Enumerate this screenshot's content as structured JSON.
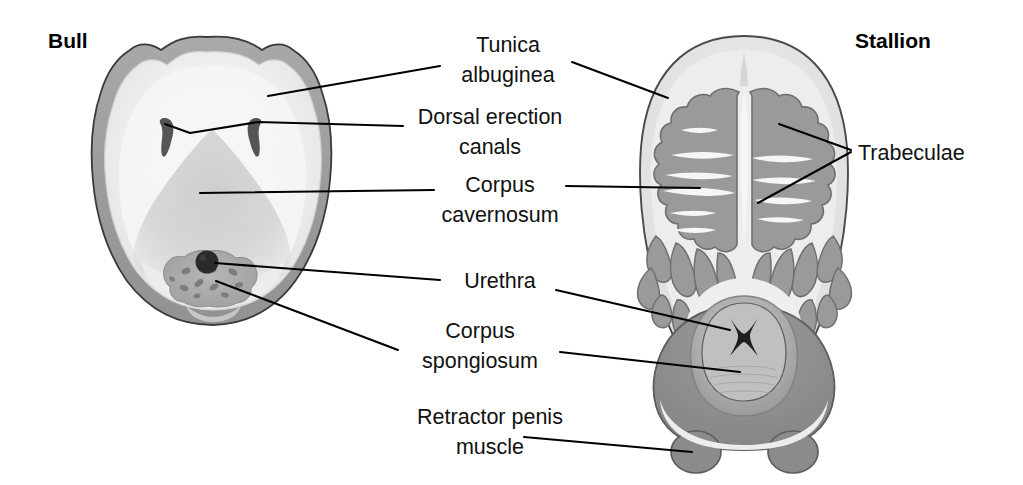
{
  "figure": {
    "kind": "comparative-anatomy-cross-section",
    "background_color": "#ffffff"
  },
  "species": [
    {
      "id": "bull",
      "title": "Bull",
      "title_x": 48,
      "title_y": 48
    },
    {
      "id": "stallion",
      "title": "Stallion",
      "title_x": 855,
      "title_y": 48
    }
  ],
  "labels": [
    {
      "id": "tunica-albuginea",
      "lines": [
        "Tunica",
        "albuginea"
      ],
      "x": 508,
      "y": 52,
      "line_height": 30,
      "anchor": "middle"
    },
    {
      "id": "dorsal-erection-canals",
      "lines": [
        "Dorsal erection",
        "canals"
      ],
      "x": 490,
      "y": 124,
      "line_height": 30,
      "anchor": "middle"
    },
    {
      "id": "corpus-cavernosum",
      "lines": [
        "Corpus",
        "cavernosum"
      ],
      "x": 500,
      "y": 192,
      "line_height": 30,
      "anchor": "middle"
    },
    {
      "id": "urethra",
      "lines": [
        "Urethra"
      ],
      "x": 500,
      "y": 281,
      "line_height": 30,
      "anchor": "middle"
    },
    {
      "id": "corpus-spongiosum",
      "lines": [
        "Corpus",
        "spongiosum"
      ],
      "x": 480,
      "y": 338,
      "line_height": 30,
      "anchor": "middle"
    },
    {
      "id": "retractor-penis-muscle",
      "lines": [
        "Retractor penis",
        "muscle"
      ],
      "x": 490,
      "y": 424,
      "line_height": 30,
      "anchor": "middle"
    },
    {
      "id": "trabeculae",
      "lines": [
        "Trabeculae"
      ],
      "x": 858,
      "y": 152,
      "line_height": 30,
      "anchor": "start"
    }
  ],
  "colors": {
    "outline": "#3c3c3c",
    "tunica_ring": "#9e9e9e",
    "tunica_ring_stallion": "#c9c9c9",
    "cavernous_tissue_bull": "#e9e9e9",
    "cavernous_shadow_bull": "#bdbdbd",
    "trabeculae_stallion": "#9a9a9a",
    "septum_white": "#f4f4f4",
    "spongiosum": "#a8a8a8",
    "retractor_muscle": "#8e8e8e",
    "urethra_dark": "#2a2a2a",
    "leader_line": "#000000",
    "background": "#ffffff"
  },
  "anatomy_notes": {
    "bull": "Fibroelastic penis: thick tunica albuginea, small corpus cavernosum, paired dorsal erection canals, ventral corpus spongiosum containing the urethra",
    "stallion": "Vascular penis: extensive trabeculae radiating from a central septum, large corpus spongiosum with star-shaped urethral lumen, paired retractor penis muscle lobes ventrally"
  }
}
